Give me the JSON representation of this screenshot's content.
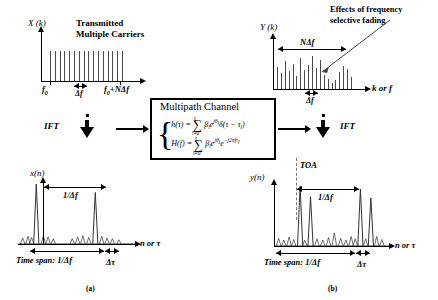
{
  "figure": {
    "caption_a": "(a)",
    "caption_b": "(b)"
  },
  "panel_tx_spectrum": {
    "y_axis_label": "X (k)",
    "title_line1": "Transmitted",
    "title_line2": "Multiple Carriers",
    "tick_start_label": "f0",
    "tick_end_label": "f0+NΔf",
    "spacing_label": "Δf"
  },
  "panel_rx_spectrum": {
    "y_axis_label": "Y (k)",
    "span_label": "NΔf",
    "spacing_label": "Δf",
    "x_axis_label": "k or f",
    "annotation_line1": "Effects of frequency",
    "annotation_line2": "selective fading"
  },
  "channel": {
    "title": "Multipath Channel",
    "equation_h": "h(τ) = ∑ βₗeĵθₗ δ(τ − τₗ)",
    "equation_H": "H(f) = ∑ βₗeĵθₗ e⁻ĵ²πᶠτₗ",
    "eq_h_lhs": "h(τ) =",
    "eq_H_lhs": "H(f) =",
    "sum_lower": "l=0",
    "sum_upper": "L",
    "eq_h_rhs": "β",
    "eq_h_tail": "δ(τ − τ",
    "brace": "{"
  },
  "transforms": {
    "ift_left_label": "IFT",
    "ift_right_label": "IFT"
  },
  "panel_tx_time": {
    "y_axis_label": "x(n)",
    "period_label": "1/Δf",
    "x_axis_label": "n or τ",
    "time_span_label": "Time span: 1/Δf",
    "delta_tau_label": "Δτ"
  },
  "panel_rx_time": {
    "y_axis_label": "y(n)",
    "toa_label": "TOA",
    "period_label": "1/Δf",
    "x_axis_label": "n or τ",
    "time_span_label": "Time span: 1/Δf",
    "delta_tau_label": "Δτ"
  },
  "chart_data": [
    {
      "type": "bar",
      "name": "transmitted_spectrum",
      "title": "Transmitted Multiple Carriers",
      "ylabel": "X (k)",
      "xlabel": "",
      "xticklabels": [
        "f0",
        "f0+NΔf"
      ],
      "categories": [
        1,
        2,
        3,
        4,
        5,
        6,
        7,
        8,
        9,
        10,
        11,
        12,
        13,
        14,
        15,
        16
      ],
      "values": [
        1,
        1,
        1,
        1,
        1,
        1,
        1,
        1,
        1,
        1,
        1,
        1,
        1,
        1,
        1,
        1
      ],
      "ylim": [
        0,
        1.1
      ],
      "grid": false,
      "legend": "none",
      "annotations": [
        "Δf = subcarrier spacing"
      ]
    },
    {
      "type": "bar",
      "name": "received_spectrum",
      "title": "",
      "ylabel": "Y (k)",
      "xlabel": "k or f",
      "categories": [
        1,
        2,
        3,
        4,
        5,
        6,
        7,
        8,
        9,
        10,
        11,
        12,
        13,
        14,
        15,
        16,
        17,
        18,
        19,
        20
      ],
      "values": [
        0.62,
        0.45,
        0.8,
        0.52,
        0.72,
        0.38,
        0.88,
        0.55,
        0.7,
        0.95,
        0.6,
        0.84,
        0.4,
        0.3,
        0.18,
        0.26,
        0.48,
        0.66,
        0.58,
        0.34
      ],
      "ylim": [
        0,
        1.0
      ],
      "grid": false,
      "legend": "none",
      "annotations": [
        "NΔf span",
        "Δf spacing",
        "Effects of frequency selective fading"
      ]
    },
    {
      "type": "line",
      "name": "transmitted_time_domain",
      "title": "",
      "ylabel": "x(n)",
      "xlabel": "n or τ",
      "peaks": [
        {
          "x": 0.155,
          "height": 1.0
        },
        {
          "x": 0.655,
          "height": 0.86
        }
      ],
      "sidelobe_x": [
        0.04,
        0.085,
        0.115,
        0.215,
        0.255,
        0.3,
        0.46,
        0.505,
        0.55,
        0.6,
        0.71,
        0.755,
        0.8,
        0.855
      ],
      "sidelobe_heights": [
        0.1,
        0.13,
        0.11,
        0.14,
        0.12,
        0.09,
        0.09,
        0.12,
        0.14,
        0.11,
        0.13,
        0.1,
        0.09,
        0.07
      ],
      "ylim": [
        0,
        1.05
      ],
      "grid": false,
      "annotations": [
        "1/Δf",
        "Time span: 1/Δf",
        "Δτ"
      ]
    },
    {
      "type": "line",
      "name": "received_time_domain",
      "title": "",
      "ylabel": "y(n)",
      "xlabel": "n or τ",
      "peaks": [
        {
          "x": 0.225,
          "height": 1.0
        },
        {
          "x": 0.315,
          "height": 0.82
        },
        {
          "x": 0.745,
          "height": 0.95
        },
        {
          "x": 0.835,
          "height": 0.8
        }
      ],
      "sidelobe_x": [
        0.04,
        0.085,
        0.13,
        0.17,
        0.265,
        0.37,
        0.42,
        0.47,
        0.52,
        0.575,
        0.62,
        0.665,
        0.7,
        0.79,
        0.885,
        0.93
      ],
      "sidelobe_heights": [
        0.13,
        0.1,
        0.15,
        0.11,
        0.1,
        0.12,
        0.1,
        0.14,
        0.22,
        0.13,
        0.1,
        0.16,
        0.12,
        0.12,
        0.16,
        0.11
      ],
      "ylim": [
        0,
        1.05
      ],
      "grid": false,
      "annotations": [
        "TOA",
        "1/Δf",
        "Time span: 1/Δf",
        "Δτ"
      ]
    }
  ]
}
